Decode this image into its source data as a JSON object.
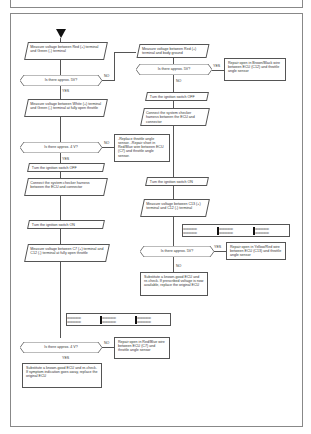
{
  "title": "1986-89 ACURA INTEGRA",
  "flowchart": {
    "left": {
      "step1": "Measure voltage between Red (+) terminal and Green (-) terminal",
      "q1": "Is there approx. 5V?",
      "q1_yes": "YES",
      "q1_no": "NO",
      "step2": "Measure voltage between White (+) terminal and Green (-) terminal at fully open throttle",
      "q2": "Is there approx. 4 V?",
      "q2_yes": "YES",
      "q2_no": "NO",
      "step3": "Turn the ignition switch OFF",
      "step4": "Connect the system checker harness between the ECU and connector",
      "step5": "Turn the ignition switch ON",
      "step6": "Measure voltage between C7 (+) terminal and C12 (-) terminal at fully open throttle",
      "q3": "Is there approx. 4 V?",
      "q3_yes": "YES",
      "q3_no": "NO",
      "q3_no_action": "Repair open in Red/Blue wire between ECU (C7) and throttle angle sensor",
      "final": "Substitute a known-good ECU and re-check. If symptom indication goes away, replace the original ECU"
    },
    "right": {
      "step1": "Measure voltage between Red (+) terminal and body ground",
      "q1": "Is there approx. 5V?",
      "q1_yes": "YES",
      "q1_no": "NO",
      "q1_yes_action": "Repair open in Brown/Black wire between ECU (C12) and throttle angle sensor",
      "step2": "Turn the ignition switch OFF",
      "step3": "Connect the system checker harness between the ECU and connector",
      "no_action_box": "-Replace throttle angle sensor. -Repair short in Red/Blue wire between ECU (C7) and throttle angle sensor.",
      "step4": "Turn the ignition switch ON",
      "step5": "Measure voltage between C13 (+) terminal and C12 (-) terminal",
      "q2": "Is there approx. 5V?",
      "q2_yes": "YES",
      "q2_no": "NO",
      "q2_yes_action": "Repair open in Yellow/Red wire between ECU (C13) and throttle angle sensor",
      "final": "Substitute a known-good ECU and re-check. If prescribed voltage is now available, replace the original ECU"
    },
    "connector_pins": "oooooooooo"
  }
}
